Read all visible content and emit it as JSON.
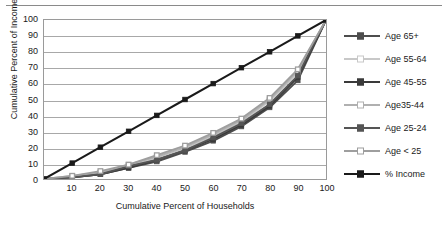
{
  "figure": {
    "has_top_rule": true,
    "background": "#ffffff"
  },
  "chart_data": {
    "type": "line",
    "title": "",
    "xlabel": "Cumulative Percent of Households",
    "ylabel": "Cumulative Percent of Income",
    "xlim": [
      0,
      100
    ],
    "ylim": [
      0,
      100
    ],
    "xticks": [
      0,
      10,
      20,
      30,
      40,
      50,
      60,
      70,
      80,
      90,
      100
    ],
    "yticks": [
      0,
      10,
      20,
      30,
      40,
      50,
      60,
      70,
      80,
      90,
      100
    ],
    "xtick_labels": [
      "0",
      "10",
      "20",
      "30",
      "40",
      "50",
      "60",
      "70",
      "80",
      "90",
      "100"
    ],
    "ytick_labels": [
      "0",
      "10",
      "20",
      "30",
      "40",
      "50",
      "60",
      "70",
      "80",
      "90",
      "100"
    ],
    "grid": "horizontal",
    "legend_position": "right",
    "x": [
      0,
      10,
      20,
      30,
      40,
      50,
      60,
      70,
      80,
      90,
      100
    ],
    "series": [
      {
        "name": "Age 65+",
        "color": "#4d4d4d",
        "marker": "square-filled",
        "values": [
          0,
          1,
          3,
          7,
          11,
          17,
          24,
          33,
          45,
          62,
          100
        ]
      },
      {
        "name": "Age 55-64",
        "color": "#c8c8c8",
        "marker": "square-open",
        "values": [
          0,
          1,
          4,
          8,
          13,
          19,
          27,
          36,
          49,
          67,
          100
        ]
      },
      {
        "name": "Age 45-55",
        "color": "#3a3a3a",
        "marker": "square-filled",
        "values": [
          0,
          1,
          3,
          7,
          12,
          18,
          25,
          34,
          46,
          64,
          100
        ]
      },
      {
        "name": "Age35-44",
        "color": "#b0b0b0",
        "marker": "square-open",
        "values": [
          0,
          2,
          4,
          9,
          14,
          20,
          28,
          37,
          50,
          68,
          100
        ]
      },
      {
        "name": "Age 25-24",
        "color": "#555555",
        "marker": "square-filled",
        "values": [
          0,
          1,
          3,
          8,
          12,
          18,
          26,
          35,
          47,
          65,
          100
        ]
      },
      {
        "name": "Age < 25",
        "color": "#9e9e9e",
        "marker": "square-open",
        "values": [
          0,
          2,
          5,
          9,
          15,
          21,
          29,
          38,
          51,
          69,
          100
        ]
      },
      {
        "name": "% Income",
        "color": "#1a1a1a",
        "marker": "square-filled",
        "values": [
          0,
          10,
          20,
          30,
          40,
          50,
          60,
          70,
          80,
          90,
          100
        ]
      }
    ]
  }
}
